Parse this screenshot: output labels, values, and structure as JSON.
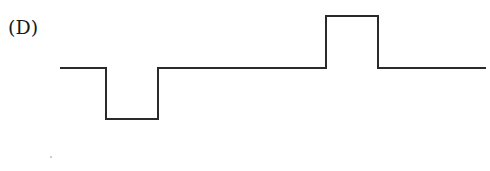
{
  "figure": {
    "label": "(D)",
    "waveform": {
      "description": "Square pulse waveform: baseline, negative pulse, baseline, positive pulse, baseline",
      "stroke_color": "#2a2a2a",
      "points": [
        [
          60,
          68
        ],
        [
          106,
          68
        ],
        [
          106,
          119
        ],
        [
          158,
          119
        ],
        [
          158,
          68
        ],
        [
          326,
          68
        ],
        [
          326,
          16
        ],
        [
          378,
          16
        ],
        [
          378,
          68
        ],
        [
          486,
          68
        ]
      ]
    }
  }
}
